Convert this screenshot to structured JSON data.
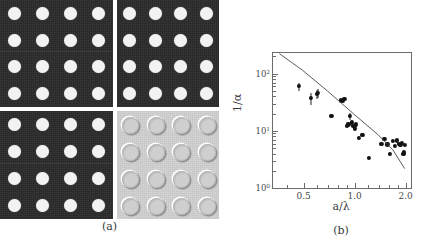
{
  "figure": {
    "panels": [
      {
        "id": "panel-a",
        "caption": "(a)",
        "name": "sem-micrograph-array",
        "subpanels": [
          {
            "name": "micrograph-top-left",
            "tone": "dark",
            "rows": 4,
            "cols": 4,
            "hole_style": "filled-bright"
          },
          {
            "name": "micrograph-top-right",
            "tone": "dark",
            "rows": 4,
            "cols": 4,
            "hole_style": "filled-bright"
          },
          {
            "name": "micrograph-bottom-left",
            "tone": "dark",
            "rows": 4,
            "cols": 4,
            "hole_style": "filled-bright"
          },
          {
            "name": "micrograph-bottom-right",
            "tone": "bright",
            "rows": 4,
            "cols": 4,
            "hole_style": "embossed-ring"
          }
        ]
      },
      {
        "id": "panel-b",
        "caption": "(b)",
        "name": "loglog-scatter-plot"
      }
    ]
  },
  "chart_data": {
    "type": "scatter",
    "title": "",
    "xlabel": "a/λ",
    "ylabel": "1/α",
    "xscale": "log",
    "yscale": "log",
    "xlim": [
      0.33,
      2.15
    ],
    "ylim": [
      1,
      230
    ],
    "grid": false,
    "legend": null,
    "xticklabels": [
      "0.5",
      "1.0",
      "2.0"
    ],
    "xtickvalues": [
      0.5,
      1.0,
      2.0
    ],
    "yticklabels": [
      "10⁰",
      "10¹",
      "10²"
    ],
    "ytickvalues": [
      1,
      10,
      100
    ],
    "x": [
      0.47,
      0.55,
      0.6,
      0.61,
      0.73,
      0.83,
      0.85,
      0.87,
      0.9,
      0.92,
      0.94,
      0.96,
      0.98,
      1.0,
      1.02,
      1.06,
      1.1,
      1.12,
      1.22,
      1.44,
      1.5,
      1.56,
      1.62,
      1.68,
      1.72,
      1.78,
      1.82,
      1.86,
      1.9,
      1.94,
      1.96,
      1.98
    ],
    "y": [
      62,
      38,
      44,
      46,
      18,
      34,
      33,
      36,
      12,
      13,
      18,
      14,
      12,
      11,
      13,
      7.5,
      8.5,
      8.6,
      3.4,
      6.0,
      7.2,
      5.8,
      4.0,
      6.6,
      5.5,
      6.8,
      6.0,
      5.6,
      6.2,
      3.9,
      4.2,
      5.6
    ],
    "yerr_lower": [
      12,
      10,
      8,
      9,
      0,
      0,
      0,
      0,
      0,
      0,
      2.5,
      0,
      0,
      0,
      0,
      0,
      0,
      0,
      0,
      0,
      0,
      0,
      0,
      0,
      0,
      0,
      0,
      0,
      0,
      0,
      0,
      0
    ],
    "yerr_upper": [
      8,
      8,
      7,
      9,
      0,
      0,
      0,
      0,
      0,
      0,
      2.5,
      0,
      0,
      0,
      0,
      0,
      0,
      0,
      0,
      0,
      0,
      0,
      0,
      0,
      0,
      0,
      0,
      0,
      0,
      0,
      0,
      0
    ],
    "fit_line": {
      "name": "theory-curve",
      "x": [
        0.365,
        0.5,
        0.7,
        1.0,
        1.4,
        1.7,
        2.0
      ],
      "y": [
        215,
        110,
        48,
        19,
        8.1,
        4.5,
        2.1
      ],
      "color": "#4a4a4a"
    },
    "marker_color": "#121212",
    "axis_color": "#6c6c6c"
  }
}
